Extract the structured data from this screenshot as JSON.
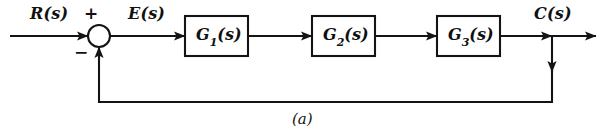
{
  "figure": {
    "type": "control-system-block-diagram",
    "caption": "(a)",
    "line_color": "#141414",
    "background_color": "#ffffff",
    "text_color": "#111111"
  },
  "signals": {
    "input": "R(s)",
    "error": "E(s)",
    "output": "C(s)"
  },
  "summing_junction": {
    "name": "summing-junction",
    "plus_sign": "+",
    "minus_sign": "−",
    "center_x": 99,
    "center_y": 36,
    "radius": 11
  },
  "blocks": [
    {
      "id": "G1",
      "label_base": "G",
      "label_sub": "1",
      "label_arg": "(s)",
      "label_full": "G1(s)",
      "x": 185,
      "y": 16,
      "width": 63,
      "height": 40
    },
    {
      "id": "G2",
      "label_base": "G",
      "label_sub": "2",
      "label_arg": "(s)",
      "label_full": "G2(s)",
      "x": 312,
      "y": 16,
      "width": 63,
      "height": 40
    },
    {
      "id": "G3",
      "label_base": "G",
      "label_sub": "3",
      "label_arg": "(s)",
      "label_full": "G3(s)",
      "x": 437,
      "y": 16,
      "width": 63,
      "height": 40
    }
  ],
  "takeoff_point": {
    "name": "output-takeoff-point",
    "x": 552,
    "y": 36
  },
  "feedback_path": {
    "name": "feedback-path",
    "corner_x": 99,
    "corner_y": 102,
    "right_x": 552
  }
}
